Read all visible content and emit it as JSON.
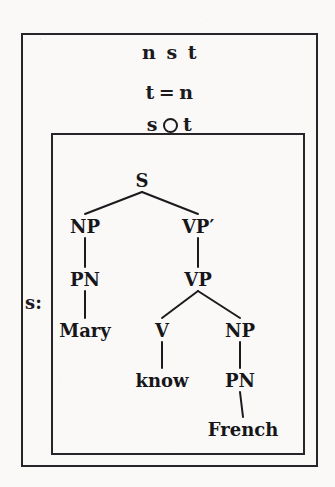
{
  "figure": {
    "kind": "nested-box-syntax-tree-diagram",
    "background_color": "#faf9f7",
    "ink_color": "#1b1b1f"
  },
  "outer_box": {
    "header": {
      "type_sequence": {
        "tokens": [
          "n",
          "s",
          "t"
        ]
      },
      "equation": {
        "left": "t",
        "operator": "=",
        "right": "n"
      },
      "composition": {
        "left": "s",
        "operator_icon": "open-circle-composition",
        "right": "t"
      }
    }
  },
  "side_label": {
    "text": "s:"
  },
  "tree": {
    "nodes": [
      {
        "id": "S",
        "label": "S",
        "x": 142,
        "y": 172,
        "kind": "nonterminal"
      },
      {
        "id": "NP1",
        "label": "NP",
        "x": 85,
        "y": 218,
        "kind": "nonterminal"
      },
      {
        "id": "VPbar",
        "label": "VP′",
        "x": 198,
        "y": 218,
        "kind": "nonterminal"
      },
      {
        "id": "PN1",
        "label": "PN",
        "x": 85,
        "y": 271,
        "kind": "nonterminal"
      },
      {
        "id": "VP",
        "label": "VP",
        "x": 198,
        "y": 271,
        "kind": "nonterminal"
      },
      {
        "id": "Mary",
        "label": "Mary",
        "x": 85,
        "y": 322,
        "kind": "terminal"
      },
      {
        "id": "V",
        "label": "V",
        "x": 162,
        "y": 322,
        "kind": "nonterminal"
      },
      {
        "id": "NP2",
        "label": "NP",
        "x": 240,
        "y": 322,
        "kind": "nonterminal"
      },
      {
        "id": "know",
        "label": "know",
        "x": 162,
        "y": 372,
        "kind": "terminal"
      },
      {
        "id": "PN2",
        "label": "PN",
        "x": 240,
        "y": 372,
        "kind": "nonterminal"
      },
      {
        "id": "French",
        "label": "French",
        "x": 243,
        "y": 421,
        "kind": "terminal"
      }
    ],
    "edges": [
      {
        "from": "S",
        "to": "NP1"
      },
      {
        "from": "S",
        "to": "VPbar"
      },
      {
        "from": "NP1",
        "to": "PN1"
      },
      {
        "from": "VPbar",
        "to": "VP"
      },
      {
        "from": "PN1",
        "to": "Mary"
      },
      {
        "from": "VP",
        "to": "V"
      },
      {
        "from": "VP",
        "to": "NP2"
      },
      {
        "from": "V",
        "to": "know"
      },
      {
        "from": "NP2",
        "to": "PN2"
      },
      {
        "from": "PN2",
        "to": "French"
      }
    ]
  }
}
